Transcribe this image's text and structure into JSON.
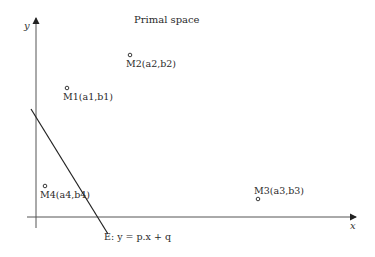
{
  "title": "Primal space",
  "axes": {
    "x_label": "x",
    "y_label": "y"
  },
  "points": [
    {
      "id": "M1",
      "label": "M1(a1,b1)",
      "cx": 67,
      "cy": 88,
      "lx": 63,
      "ly": 100
    },
    {
      "id": "M2",
      "label": "M2(a2,b2)",
      "cx": 130,
      "cy": 55,
      "lx": 126,
      "ly": 67
    },
    {
      "id": "M3",
      "label": "M3(a3,b3)",
      "cx": 258,
      "cy": 199,
      "lx": 254,
      "ly": 194
    },
    {
      "id": "M4",
      "label": "M4(a4,b4)",
      "cx": 45,
      "cy": 186,
      "lx": 40,
      "ly": 198
    }
  ],
  "line": {
    "label": "E: y = p.x + q",
    "color": "#222222"
  },
  "colors": {
    "axis": "#444444",
    "line": "#222222",
    "text": "#2a2a2a"
  }
}
